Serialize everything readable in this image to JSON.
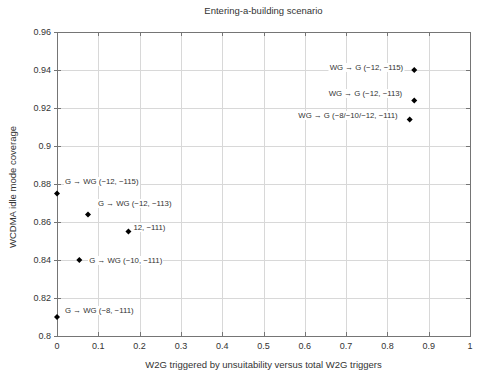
{
  "figure": {
    "background_color": "#ffffff",
    "border_color": "#757575",
    "grid_color": "#d8d8d8",
    "tick_color": "#757575",
    "text_color": "#333333"
  },
  "chart_data": {
    "type": "scatter",
    "title": "Entering-a-building scenario",
    "xlabel": "W2G triggered by unsuitability versus total W2G triggers",
    "ylabel": "WCDMA idle mode coverage",
    "xlim": [
      0,
      1
    ],
    "ylim": [
      0.8,
      0.96
    ],
    "xticks": [
      0,
      0.1,
      0.2,
      0.3,
      0.4,
      0.5,
      0.6,
      0.7,
      0.8,
      0.9,
      1
    ],
    "xtick_labels": [
      "0",
      "0.1",
      "0.2",
      "0.3",
      "0.4",
      "0.5",
      "0.6",
      "0.7",
      "0.8",
      "0.9",
      "1"
    ],
    "yticks": [
      0.96,
      0.94,
      0.92,
      0.9,
      0.88,
      0.86,
      0.84,
      0.82,
      0.8
    ],
    "ytick_labels": [
      "0.96",
      "0.94",
      "0.92",
      "0.9",
      "0.88",
      "0.86",
      "0.84",
      "0.82",
      "0.8"
    ],
    "grid": true,
    "legend": false,
    "marker": {
      "shape": "diamond",
      "color": "#000000",
      "size": 3
    },
    "points": [
      {
        "x": 0.0,
        "y": 0.875,
        "label": "G → WG (−12, −115)",
        "label_anchor": "start",
        "label_dx": 7,
        "label_dy": -12
      },
      {
        "x": 0.075,
        "y": 0.864,
        "label": "G → WG (−12, −113)",
        "label_anchor": "start",
        "label_dx": 9,
        "label_dy": -10
      },
      {
        "x": 0.173,
        "y": 0.855,
        "label": "12, −111)",
        "label_anchor": "start",
        "label_dx": 4,
        "label_dy": -4
      },
      {
        "x": 0.054,
        "y": 0.84,
        "label": "G → WG (−10, −111)",
        "label_anchor": "start",
        "label_dx": 9,
        "label_dy": 1
      },
      {
        "x": 0.0,
        "y": 0.81,
        "label": "G → WG (−8, −111)",
        "label_anchor": "start",
        "label_dx": 7,
        "label_dy": -6
      },
      {
        "x": 0.865,
        "y": 0.94,
        "label": "WG → G (−12, −115)",
        "label_anchor": "end",
        "label_dx": -10,
        "label_dy": -2
      },
      {
        "x": 0.865,
        "y": 0.924,
        "label": "WG → G (−12, −113)",
        "label_anchor": "end",
        "label_dx": -11,
        "label_dy": -6
      },
      {
        "x": 0.854,
        "y": 0.914,
        "label": "WG → G (−8/−10/−12, −111)",
        "label_anchor": "end",
        "label_dx": -11,
        "label_dy": -3
      }
    ]
  }
}
